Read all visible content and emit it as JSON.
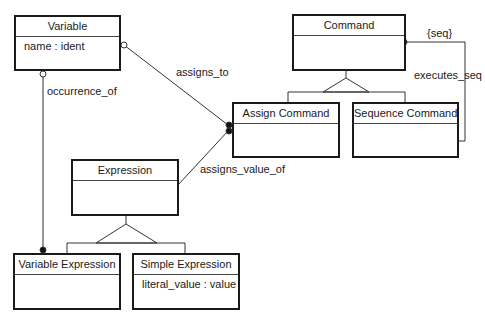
{
  "diagram": {
    "type": "class-diagram",
    "classes": [
      {
        "id": "variable",
        "name": "Variable",
        "attributes": [
          "name : ident"
        ]
      },
      {
        "id": "command",
        "name": "Command",
        "attributes": []
      },
      {
        "id": "assign_command",
        "name": "Assign Command",
        "attributes": []
      },
      {
        "id": "sequence_command",
        "name": "Sequence Command",
        "attributes": []
      },
      {
        "id": "expression",
        "name": "Expression",
        "attributes": []
      },
      {
        "id": "variable_expression",
        "name": "Variable Expression",
        "attributes": []
      },
      {
        "id": "simple_expression",
        "name": "Simple Expression",
        "attributes": [
          "literal_value : value"
        ]
      }
    ],
    "associations": [
      {
        "label": "assigns_to",
        "from": "variable",
        "to": "assign_command",
        "from_end": "hollow-circle",
        "to_end": "filled-dot"
      },
      {
        "label": "occurrence_of",
        "from": "variable",
        "to": "variable_expression",
        "from_end": "hollow-circle",
        "to_end": "filled-dot"
      },
      {
        "label": "assigns_value_of",
        "from": "expression",
        "to": "assign_command",
        "to_end": "filled-dot"
      },
      {
        "label": "executes_seq",
        "from": "sequence_command",
        "to": "command",
        "to_end": "filled-dot",
        "constraint": "{seq}"
      }
    ],
    "generalizations": [
      {
        "parent": "command",
        "children": [
          "assign_command",
          "sequence_command"
        ]
      },
      {
        "parent": "expression",
        "children": [
          "variable_expression",
          "simple_expression"
        ]
      }
    ]
  }
}
